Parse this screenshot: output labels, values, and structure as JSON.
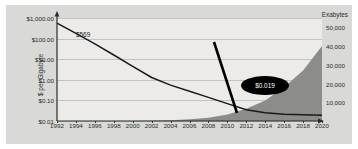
{
  "chart_data": {
    "type": "line",
    "title": "",
    "xlabel": "",
    "ylabel": "$ per Gigabyte",
    "y2label": "Exabytes",
    "x_ticks": [
      "1992",
      "1994",
      "1996",
      "1998",
      "2000",
      "2002",
      "2004",
      "2006",
      "2008",
      "2010",
      "2012",
      "2014",
      "2016",
      "2018",
      "2020"
    ],
    "y_ticks_left": [
      "$1,000.00",
      "$100.00",
      "$10.00",
      "$1.00",
      "$0.10",
      "$0.01"
    ],
    "y_ticks_right": [
      "50,000",
      "40,000",
      "30,000",
      "20,000",
      "10,000"
    ],
    "ylim_left": [
      0.01,
      1000
    ],
    "ylim_right": [
      0,
      55000
    ],
    "y_left_scale": "log",
    "grid": true,
    "legend": "none",
    "annotations": [
      {
        "name": "start-price",
        "text": "$569",
        "x": 1992,
        "y": 569
      },
      {
        "name": "end-price-callout",
        "text": "$0.019",
        "x": 2016,
        "y": 0.019
      }
    ],
    "series": [
      {
        "name": "$ per Gigabyte",
        "axis": "left",
        "style": "line",
        "color": "#1a1a1a",
        "x": [
          1992,
          1994,
          1996,
          1998,
          2000,
          2002,
          2004,
          2006,
          2008,
          2010,
          2012,
          2014,
          2016,
          2018,
          2020
        ],
        "values": [
          569,
          180,
          55,
          16,
          4.5,
          1.3,
          0.55,
          0.28,
          0.14,
          0.07,
          0.035,
          0.025,
          0.021,
          0.02,
          0.019
        ]
      },
      {
        "name": "Exabytes",
        "axis": "right",
        "style": "area",
        "color": "#8c8c8a",
        "x": [
          1992,
          1994,
          1996,
          1998,
          2000,
          2002,
          2004,
          2006,
          2008,
          2010,
          2012,
          2014,
          2016,
          2018,
          2020
        ],
        "values": [
          0,
          0,
          0,
          0,
          50,
          150,
          400,
          900,
          1800,
          3500,
          6500,
          11000,
          18000,
          27000,
          40000
        ]
      }
    ],
    "colors": {
      "panel": "#d9d9d7",
      "plot": "#ecebe9",
      "grid": "#c2c2c0",
      "price_line": "#1a1a1a",
      "area_fill": "#8c8c8a",
      "callout_bg": "#000000",
      "callout_text": "#ffffff"
    }
  }
}
